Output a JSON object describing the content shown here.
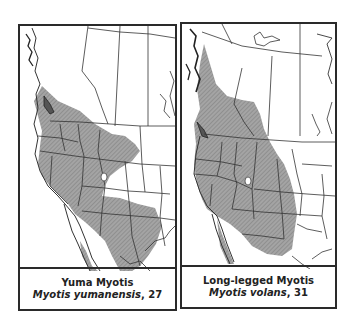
{
  "maps": [
    {
      "common_name": "Yuma Myotis",
      "scientific_name": "Myotis yumanensis",
      "plate_number": "27",
      "range_fill": "#9a9a9a"
    },
    {
      "common_name": "Long-legged Myotis",
      "scientific_name": "Myotis volans",
      "plate_number": "31",
      "range_fill": "#9a9a9a"
    }
  ],
  "colors": {
    "border": "#2a2a2a",
    "background": "#ffffff",
    "range_shading": "#9a9a9a",
    "boundary_lines": "#333333"
  }
}
